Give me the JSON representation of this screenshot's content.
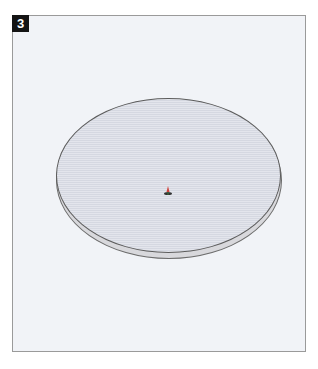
{
  "step": {
    "number": "3"
  },
  "scene": {
    "object": "flat-cylinder-disc",
    "disc_fill": "#dcdfe7",
    "disc_outline": "#5c5c5c",
    "background": "#f1f3f7",
    "origin_marker": "axes-origin-icon"
  }
}
